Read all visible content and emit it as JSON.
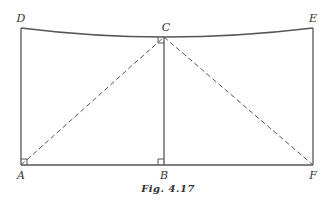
{
  "figure": {
    "caption": "Fig. 4.17",
    "points": {
      "A": {
        "label": "A",
        "x": 21,
        "y": 165
      },
      "B": {
        "label": "B",
        "x": 164,
        "y": 165
      },
      "F": {
        "label": "F",
        "x": 313,
        "y": 165
      },
      "D": {
        "label": "D",
        "x": 21,
        "y": 28
      },
      "C": {
        "label": "C",
        "x": 164,
        "y": 37
      },
      "E": {
        "label": "E",
        "x": 313,
        "y": 28
      }
    },
    "segments": [
      {
        "from": "A",
        "to": "F",
        "style": "solid"
      },
      {
        "from": "A",
        "to": "D",
        "style": "solid"
      },
      {
        "from": "B",
        "to": "C",
        "style": "solid"
      },
      {
        "from": "F",
        "to": "E",
        "style": "solid"
      },
      {
        "from": "D",
        "to": "E",
        "via": "C",
        "style": "solid-curve"
      },
      {
        "from": "A",
        "to": "C",
        "style": "dashed"
      },
      {
        "from": "C",
        "to": "F",
        "style": "dashed"
      }
    ],
    "right_angle_marks": [
      "A",
      "B",
      "C"
    ],
    "colors": {
      "line": "#555555",
      "text": "#333333"
    }
  }
}
